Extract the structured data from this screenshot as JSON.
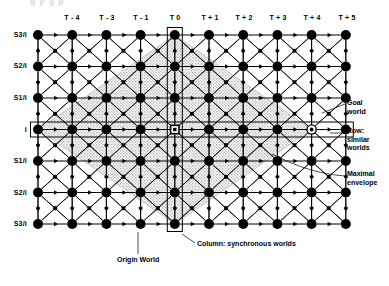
{
  "figure": {
    "ghost_caption": "g           p           g           p"
  },
  "grid": {
    "origin_x": 38,
    "origin_y": 35,
    "col_spacing": 34.2,
    "row_spacing": 31.5,
    "cols": 10,
    "rows": 7,
    "node_radius": 5.0,
    "mid_marker_size": 2.2
  },
  "columns": [
    {
      "index": 0,
      "label": ""
    },
    {
      "index": 1,
      "label": "T - 4"
    },
    {
      "index": 2,
      "label": "T - 3"
    },
    {
      "index": 3,
      "label": "T - 1"
    },
    {
      "index": 4,
      "label": "T 0"
    },
    {
      "index": 5,
      "label": "T + 1"
    },
    {
      "index": 6,
      "label": "T + 2"
    },
    {
      "index": 7,
      "label": "T + 3"
    },
    {
      "index": 8,
      "label": "T + 4"
    },
    {
      "index": 9,
      "label": "T + 5"
    }
  ],
  "rows": [
    {
      "index": 0,
      "label": "S3/i"
    },
    {
      "index": 1,
      "label": "S2/i"
    },
    {
      "index": 2,
      "label": "S1/i"
    },
    {
      "index": 3,
      "label": "i"
    },
    {
      "index": 4,
      "label": "S1/i"
    },
    {
      "index": 5,
      "label": "S2/i"
    },
    {
      "index": 6,
      "label": "S3/i"
    }
  ],
  "markers": {
    "origin_world": {
      "col": 4,
      "row": 3,
      "kind": "boxed-square"
    },
    "goal_world": {
      "col": 8,
      "row": 3,
      "kind": "circled-node"
    },
    "origin_column_box": {
      "col": 4,
      "kind": "column-highlight-box"
    },
    "similar_row_box": {
      "row": 3,
      "kind": "row-highlight-box"
    }
  },
  "envelope": {
    "kind": "maximal-envelope-diamond",
    "center_col": 4,
    "center_row": 3,
    "half_width_cols": 4,
    "half_height_rows": 3,
    "fill": "#dedede"
  },
  "annotations": {
    "goal_world": "Goal\nworld",
    "row_similar_worlds": "Row:\nsimilar\nworlds",
    "maximal_envelope": "Maximal\nenvelope",
    "origin_world": "Origin World",
    "column_synchronous_worlds": "Column: synchronous worlds"
  },
  "colors": {
    "ink": "#000000",
    "paper": "#ffffff",
    "envelope_fill": "#dedede",
    "faint": "#d8d8d8"
  }
}
